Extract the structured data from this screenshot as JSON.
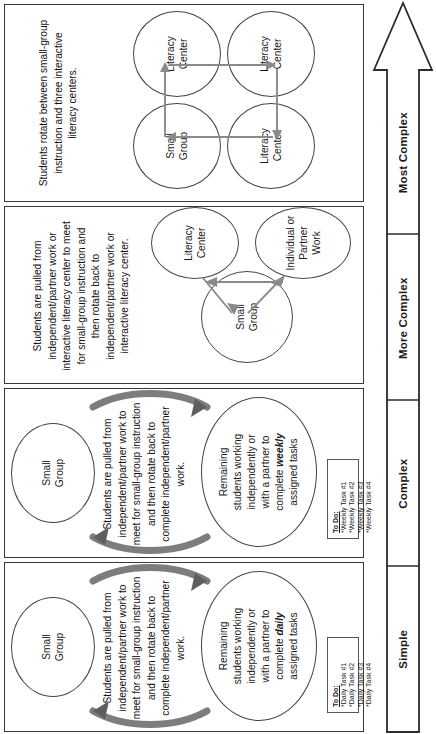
{
  "scale": {
    "name": "complexity-arrow",
    "direction": "increasing",
    "labels": [
      "Simple",
      "Complex",
      "More Complex",
      "Most Complex"
    ]
  },
  "panels": [
    {
      "id": "simple",
      "level": "Simple",
      "description": "Students are pulled from independent/partner work to meet for small-group instruction and then rotate back to complete independent/partner work.",
      "circles": [
        {
          "name": "small-group",
          "lines": [
            "Small",
            "Group"
          ]
        },
        {
          "name": "remaining-students",
          "lines": [
            "Remaining",
            "students working",
            "independently or",
            "with a partner to",
            "complete ",
            "assigned tasks"
          ],
          "emphasis": "daily"
        }
      ],
      "arrows": {
        "style": "curved-double-arc",
        "count": 2
      },
      "todo": {
        "title": "To Do:",
        "items": [
          "*Daily Task #1",
          "*Daily Task #2",
          "*Daily Task #3",
          "*Daily Task #4"
        ]
      }
    },
    {
      "id": "complex",
      "level": "Complex",
      "description": "Students are pulled from independent/partner work to meet for small-group instruction and then rotate back to complete independent/partner work.",
      "circles": [
        {
          "name": "small-group",
          "lines": [
            "Small",
            "Group"
          ]
        },
        {
          "name": "remaining-students",
          "lines": [
            "Remaining",
            "students working",
            "independently or",
            "with a partner to",
            "complete ",
            "assigned tasks"
          ],
          "emphasis": "weekly"
        }
      ],
      "arrows": {
        "style": "curved-double-arc",
        "count": 2
      },
      "todo": {
        "title": "To Do:",
        "items": [
          "*Weekly Task #1",
          "*Weekly Task #2",
          "*Weekly Task #3",
          "*Weekly Task #4"
        ]
      }
    },
    {
      "id": "more-complex",
      "level": "More Complex",
      "description": "Students are pulled from independent/partner work or interactive literacy center to meet for small-group instruction and then rotate back to independent/partner work or interactive literacy center.",
      "circles": [
        {
          "name": "small-group",
          "lines": [
            "Small",
            "Group"
          ]
        },
        {
          "name": "literacy-center",
          "lines": [
            "Literacy",
            "Center"
          ]
        },
        {
          "name": "individual-or-partner-work",
          "lines": [
            "Individual or",
            "Partner",
            "Work"
          ]
        }
      ],
      "arrows": {
        "style": "triangle-cycle",
        "count": 3
      }
    },
    {
      "id": "most-complex",
      "level": "Most Complex",
      "description": "Students rotate between small-group instruction and three interactive literacy centers.",
      "circles": [
        {
          "name": "small-group",
          "lines": [
            "Small",
            "Group"
          ]
        },
        {
          "name": "literacy-center-1",
          "lines": [
            "Literacy",
            "Center"
          ]
        },
        {
          "name": "literacy-center-2",
          "lines": [
            "Literacy",
            "Center"
          ]
        },
        {
          "name": "literacy-center-3",
          "lines": [
            "Literacy",
            "Center"
          ]
        }
      ],
      "arrows": {
        "style": "rectangular-cycle",
        "count": 4
      }
    }
  ],
  "colors": {
    "outline": "#3a3a3a",
    "circle_outline": "#444444",
    "arc_gray": "#7d7d7d",
    "thin_arrow": "#8a8a8a",
    "text": "#1a1a1a",
    "background": "#ffffff"
  }
}
